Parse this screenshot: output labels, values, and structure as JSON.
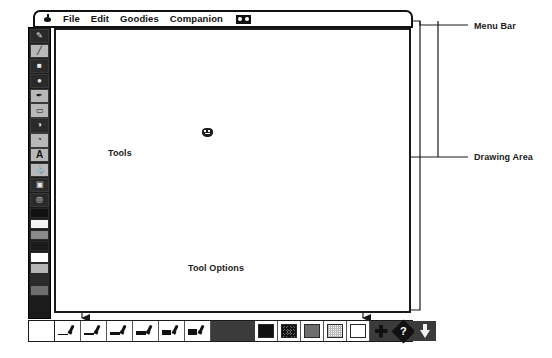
{
  "app": {
    "title": "Paint Application Interface Diagram",
    "menu_bar": {
      "apple_icon": "apple-icon",
      "items": [
        "File",
        "Edit",
        "Goodies",
        "Companion"
      ],
      "trailing_icon": "glasses-icon"
    },
    "tool_palette": {
      "label": "Tools",
      "tools": [
        {
          "name": "pencil-tool",
          "glyph": "✎",
          "selected": true
        },
        {
          "name": "line-tool",
          "glyph": "╱",
          "selected": false
        },
        {
          "name": "rectangle-tool",
          "glyph": "■",
          "selected": true
        },
        {
          "name": "oval-tool",
          "glyph": "●",
          "selected": true
        },
        {
          "name": "brush-tool",
          "glyph": "✒",
          "selected": false
        },
        {
          "name": "eraser-tool",
          "glyph": "▭",
          "selected": false
        },
        {
          "name": "paint-bucket-tool",
          "glyph": "◑",
          "selected": true
        },
        {
          "name": "spray-can-tool",
          "glyph": "◔",
          "selected": false
        },
        {
          "name": "text-tool",
          "glyph": "A",
          "selected": false
        },
        {
          "name": "stamp-tool",
          "glyph": "⚓",
          "selected": false
        },
        {
          "name": "truck-tool",
          "glyph": "▣",
          "selected": true
        },
        {
          "name": "undo-guy-tool",
          "glyph": "◎",
          "selected": true
        }
      ],
      "swatches": [
        "#111111",
        "#f2f2f2",
        "#8a8a8a",
        "#1c1c1c",
        "#ffffff",
        "#b5b5b5",
        "#2a2a2a",
        "#6e6e6e"
      ]
    },
    "drawing_area": {
      "label": "Drawing Area",
      "cursor_icon": "canvas-sprite-icon"
    },
    "tool_options": {
      "label": "Tool Options",
      "brush_widths": [
        1,
        2,
        3,
        4,
        5,
        6
      ],
      "patterns": [
        {
          "name": "pattern-solid-black",
          "color": "#111111"
        },
        {
          "name": "pattern-dense-dither",
          "color": "#4a4a4a"
        },
        {
          "name": "pattern-medium-gray",
          "color": "#6e6e6e"
        },
        {
          "name": "pattern-light-dither",
          "color": "#cfcfcf"
        },
        {
          "name": "pattern-white",
          "color": "#ffffff"
        }
      ],
      "mixer_icon": "mix-icon",
      "help_icon": "help-diamond-icon",
      "help_glyph": "?",
      "download_icon": "down-arrow-icon"
    }
  },
  "annotations": {
    "menu_bar": "Menu Bar",
    "drawing_area": "Drawing Area",
    "tools": "Tools",
    "tool_options": "Tool Options"
  },
  "colors": {
    "ink": "#111111",
    "palette_bg": "#1b1b1b",
    "cell_bg": "#b8b8b8",
    "page_bg": "#ffffff"
  }
}
